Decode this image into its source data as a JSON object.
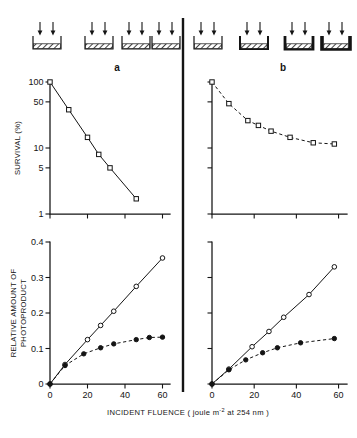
{
  "figure": {
    "panels": [
      {
        "letter": "a",
        "name": "panel-a"
      },
      {
        "letter": "b",
        "name": "panel-b"
      }
    ],
    "axis_titles": {
      "survival_y": "SURVIVAL (%)",
      "photoproduct_y_line1": "RELATIVE AMOUNT OF",
      "photoproduct_y_line2": "PHOTOPRODUCT",
      "x_main": "INCIDENT FLUENCE ( joule m",
      "x_exponent": "-2",
      "x_tail": " at 254 nm )"
    },
    "schematic": {
      "caption": "irradiation-cuvette-series",
      "arrows_per_cuvette": 2,
      "panel_a_cuvettes": [
        {
          "label": "cuvette-a-1",
          "wall": 1.2,
          "fill": "hatched"
        },
        {
          "label": "cuvette-a-2",
          "wall": 1.2,
          "fill": "hatched"
        },
        {
          "label": "cuvette-a-3",
          "wall": 1.2,
          "fill": "hatched"
        },
        {
          "label": "cuvette-a-4",
          "wall": 1.2,
          "fill": "hatched"
        }
      ],
      "panel_b_cuvettes": [
        {
          "label": "cuvette-b-1",
          "wall": 1.2,
          "fill": "hatched"
        },
        {
          "label": "cuvette-b-2",
          "wall": 2.0,
          "fill": "hatched"
        },
        {
          "label": "cuvette-b-3",
          "wall": 2.8,
          "fill": "hatched"
        },
        {
          "label": "cuvette-b-4",
          "wall": 3.6,
          "fill": "hatched"
        }
      ]
    }
  },
  "chart_data": [
    {
      "id": "survival-a",
      "type": "line",
      "title": "",
      "panel": "a",
      "xlabel": "INCIDENT FLUENCE (joule m-2 at 254 nm)",
      "ylabel": "SURVIVAL (%)",
      "yscale": "log",
      "ylim": [
        1,
        100
      ],
      "xlim": [
        0,
        64
      ],
      "yticks": [
        100,
        50,
        10,
        5,
        1
      ],
      "ytick_labels": [
        "100",
        "50",
        "10",
        "5",
        "1"
      ],
      "xticks": [
        0,
        20,
        40,
        60
      ],
      "xtick_labels": [
        "0",
        "20",
        "40",
        "60"
      ],
      "grid": false,
      "legend": "none",
      "series": [
        {
          "name": "survival",
          "marker": "open-square",
          "linestyle": "solid",
          "x": [
            0,
            10,
            20,
            26,
            32,
            46
          ],
          "y": [
            100,
            38,
            14.5,
            8.0,
            5.0,
            1.7
          ]
        }
      ]
    },
    {
      "id": "survival-b",
      "type": "line",
      "title": "",
      "panel": "b",
      "xlabel": "INCIDENT FLUENCE (joule m-2 at 254 nm)",
      "ylabel": "SURVIVAL (%)",
      "yscale": "log",
      "ylim": [
        1,
        100
      ],
      "xlim": [
        0,
        64
      ],
      "yticks": [
        100,
        50,
        10,
        5,
        1
      ],
      "ytick_labels": [
        "100",
        "50",
        "10",
        "5",
        "1"
      ],
      "xticks": [
        0,
        20,
        40,
        60
      ],
      "xtick_labels": [
        "0",
        "20",
        "40",
        "60"
      ],
      "grid": false,
      "legend": "none",
      "series": [
        {
          "name": "survival",
          "marker": "open-square",
          "linestyle": "dashed",
          "x": [
            0,
            8,
            17,
            22,
            28,
            37,
            48,
            58
          ],
          "y": [
            100,
            47,
            26,
            22,
            18,
            14.5,
            12,
            11.5
          ]
        }
      ]
    },
    {
      "id": "photoproduct-a",
      "type": "line",
      "title": "",
      "panel": "a",
      "xlabel": "INCIDENT FLUENCE (joule m-2 at 254 nm)",
      "ylabel": "RELATIVE AMOUNT OF PHOTOPRODUCT",
      "yscale": "linear",
      "ylim": [
        0,
        0.4
      ],
      "xlim": [
        0,
        64
      ],
      "yticks": [
        0,
        0.1,
        0.2,
        0.3,
        0.4
      ],
      "ytick_labels": [
        "0",
        "0.1",
        "0.2",
        "0.3",
        "0.4"
      ],
      "xticks": [
        0,
        20,
        40,
        60
      ],
      "xtick_labels": [
        "0",
        "20",
        "40",
        "60"
      ],
      "grid": false,
      "legend": "none",
      "series": [
        {
          "name": "photoproduct-open",
          "marker": "open-circle",
          "linestyle": "solid",
          "x": [
            0,
            8,
            20,
            27,
            34,
            46,
            60
          ],
          "y": [
            0,
            0.055,
            0.125,
            0.165,
            0.205,
            0.275,
            0.355
          ]
        },
        {
          "name": "photoproduct-filled",
          "marker": "filled-circle",
          "linestyle": "dashed",
          "x": [
            0,
            8,
            18,
            27,
            34,
            46,
            53,
            60
          ],
          "y": [
            0,
            0.052,
            0.085,
            0.102,
            0.113,
            0.125,
            0.131,
            0.132
          ]
        }
      ]
    },
    {
      "id": "photoproduct-b",
      "type": "line",
      "title": "",
      "panel": "b",
      "xlabel": "INCIDENT FLUENCE (joule m-2 at 254 nm)",
      "ylabel": "RELATIVE AMOUNT OF PHOTOPRODUCT",
      "yscale": "linear",
      "ylim": [
        0,
        0.4
      ],
      "xlim": [
        0,
        64
      ],
      "yticks": [
        0,
        0.1,
        0.2,
        0.3,
        0.4
      ],
      "ytick_labels": [
        "0",
        "0.1",
        "0.2",
        "0.3",
        "0.4"
      ],
      "xticks": [
        0,
        20,
        40,
        60
      ],
      "xtick_labels": [
        "0",
        "20",
        "40",
        "60"
      ],
      "grid": false,
      "legend": "none",
      "series": [
        {
          "name": "photoproduct-open",
          "marker": "open-circle",
          "linestyle": "solid",
          "x": [
            0,
            8,
            19,
            27,
            34,
            46,
            58
          ],
          "y": [
            0,
            0.042,
            0.105,
            0.148,
            0.188,
            0.252,
            0.33
          ]
        },
        {
          "name": "photoproduct-filled",
          "marker": "filled-circle",
          "linestyle": "dashed",
          "x": [
            0,
            8,
            16,
            24,
            31,
            42,
            58
          ],
          "y": [
            0,
            0.04,
            0.068,
            0.088,
            0.102,
            0.116,
            0.128
          ]
        }
      ]
    }
  ]
}
